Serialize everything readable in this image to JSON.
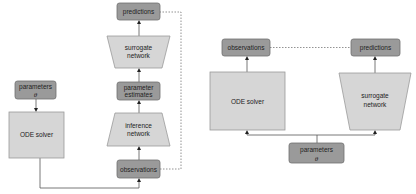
{
  "colors": {
    "dark_box_fill": "#9a9a9a",
    "dark_box_stroke": "#6f6f6f",
    "light_box_fill": "#d6d6d6",
    "light_box_stroke": "#9a9a9a",
    "line": "#555555"
  },
  "left_diagram": {
    "parameters": {
      "line1": "parameters",
      "line2": "θ"
    },
    "ode_solver": {
      "label": "ODE solver"
    },
    "observations": {
      "label": "observations"
    },
    "inference_network": {
      "line1": "inference",
      "line2": "network"
    },
    "parameter_estimates": {
      "line1": "parameter",
      "line2": "estimates"
    },
    "surrogate_network": {
      "line1": "surrogate",
      "line2": "network"
    },
    "predictions": {
      "label": "predictions"
    }
  },
  "right_diagram": {
    "observations": {
      "label": "observations"
    },
    "predictions": {
      "label": "predictions"
    },
    "ode_solver": {
      "label": "ODE solver"
    },
    "surrogate_network": {
      "line1": "surrogate",
      "line2": "network"
    },
    "parameters": {
      "line1": "parameters",
      "line2": "θ"
    }
  }
}
